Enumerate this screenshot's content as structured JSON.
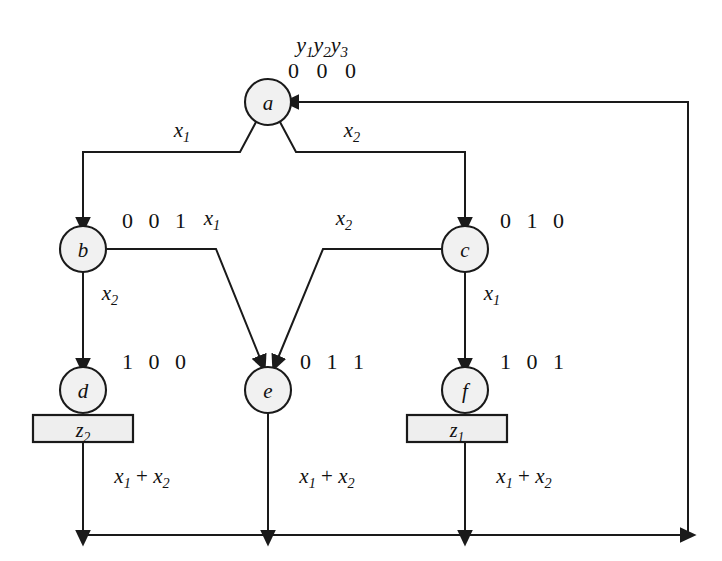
{
  "figure": {
    "kind": "state-transition-diagram",
    "background_color": "#ffffff",
    "line_color": "#1a1a1a",
    "node_fill": "#f1f1f1",
    "output_box_fill": "#eeeeee"
  },
  "header": {
    "state_vars": "y",
    "state_var_subs": [
      "1",
      "2",
      "3"
    ],
    "root_code": "0 0 0"
  },
  "states": [
    {
      "id": "a",
      "label": "a",
      "code": "",
      "cx": 268,
      "cy": 102,
      "r": 23
    },
    {
      "id": "b",
      "label": "b",
      "code": "0 0 1",
      "cx": 83,
      "cy": 249,
      "r": 23
    },
    {
      "id": "c",
      "label": "c",
      "code": "0 1 0",
      "cx": 465,
      "cy": 249,
      "r": 23
    },
    {
      "id": "d",
      "label": "d",
      "code": "1 0 0",
      "cx": 83,
      "cy": 390,
      "r": 23
    },
    {
      "id": "e",
      "label": "e",
      "code": "0 1 1",
      "cx": 268,
      "cy": 390,
      "r": 23
    },
    {
      "id": "f",
      "label": "f",
      "code": "1 0 1",
      "cx": 465,
      "cy": 390,
      "r": 23
    }
  ],
  "output_boxes": [
    {
      "id": "z2-box",
      "state": "d",
      "label": "z",
      "sub": "2",
      "x": 33,
      "y": 415,
      "w": 100,
      "h": 27
    },
    {
      "id": "z1-box",
      "state": "f",
      "label": "z",
      "sub": "1",
      "x": 407,
      "y": 415,
      "w": 100,
      "h": 27
    }
  ],
  "transitions": [
    {
      "id": "a-to-b",
      "from": "a",
      "to": "b",
      "label": "x",
      "sub": "1",
      "label_x": 182,
      "label_y": 137
    },
    {
      "id": "a-to-c",
      "from": "a",
      "to": "c",
      "label": "x",
      "sub": "2",
      "label_x": 352,
      "label_y": 137
    },
    {
      "id": "b-to-d",
      "from": "b",
      "to": "d",
      "label": "x",
      "sub": "2",
      "label_x": 110,
      "label_y": 300
    },
    {
      "id": "b-to-e",
      "from": "b",
      "to": "e",
      "label": "x",
      "sub": "1",
      "label_x": 212,
      "label_y": 225
    },
    {
      "id": "c-to-e",
      "from": "c",
      "to": "e",
      "label": "x",
      "sub": "2",
      "label_x": 344,
      "label_y": 225
    },
    {
      "id": "c-to-f",
      "from": "c",
      "to": "f",
      "label": "x",
      "sub": "1",
      "label_x": 492,
      "label_y": 300
    },
    {
      "id": "d-to-a",
      "from": "d",
      "to": "a",
      "label": "x",
      "sub": "1",
      "op": " + ",
      "label2": "x",
      "sub2": "2",
      "label_x": 142,
      "label_y": 483
    },
    {
      "id": "e-to-a",
      "from": "e",
      "to": "a",
      "label": "x",
      "sub": "1",
      "op": " + ",
      "label2": "x",
      "sub2": "2",
      "label_x": 327,
      "label_y": 483
    },
    {
      "id": "f-to-a",
      "from": "f",
      "to": "a",
      "label": "x",
      "sub": "1",
      "op": " + ",
      "label2": "x",
      "sub2": "2",
      "label_x": 524,
      "label_y": 483
    }
  ],
  "state_code_labels": [
    {
      "for": "b",
      "text": "0 0 1",
      "x": 122,
      "y": 228
    },
    {
      "for": "c",
      "text": "0 1 0",
      "x": 500,
      "y": 228
    },
    {
      "for": "d",
      "text": "1 0 0",
      "x": 122,
      "y": 369
    },
    {
      "for": "e",
      "text": "0 1 1",
      "x": 300,
      "y": 369
    },
    {
      "for": "f",
      "text": "1 0 1",
      "x": 500,
      "y": 369
    }
  ],
  "feedback": {
    "bottom_y": 535,
    "right_x": 688,
    "entry_y": 102,
    "left_x": 83
  }
}
